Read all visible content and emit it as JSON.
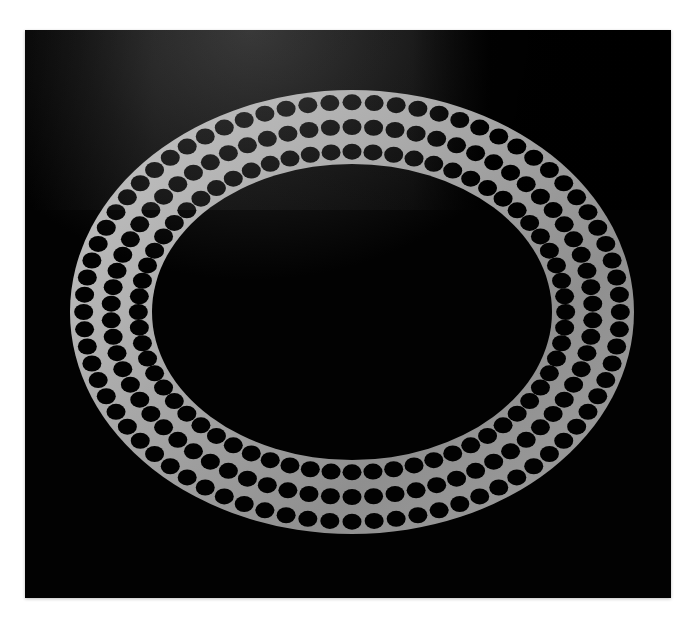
{
  "image": {
    "subject": "perforated metal ring",
    "description": "Brushed silver elliptical ring with three staggered rows of circular holes, photographed on a black background",
    "colors": {
      "background_page": "#ffffff",
      "backdrop": "#000000",
      "metal_light": "#c9c9c9",
      "metal_mid": "#9a9a9a",
      "metal_dark": "#6e6e6e",
      "hole": "#050505"
    },
    "ring": {
      "center_x": 352,
      "center_y": 312,
      "outer_rx": 282,
      "outer_ry": 222,
      "inner_rx": 200,
      "inner_ry": 148,
      "hole_rows": 3
    }
  }
}
